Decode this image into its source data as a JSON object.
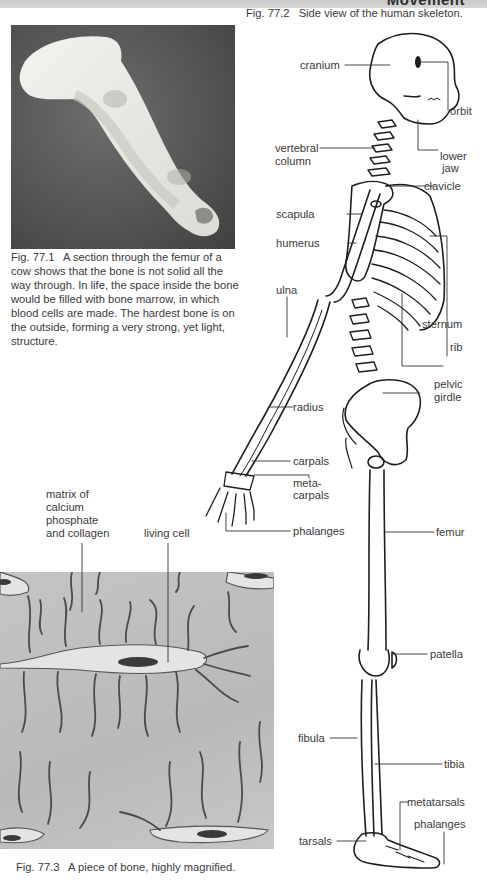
{
  "header": {
    "title": "Movement"
  },
  "figures": {
    "fig1": {
      "number": "Fig. 77.1",
      "caption": "A section through the femur of a cow shows that the bone is not solid all the way through. In life, the space inside the bone would be filled with bone marrow, in which blood cells are made. The hardest bone is on the outside, forming a very strong, yet light, structure.",
      "image_alt": "Photograph of a sectioned cow femur on a dark grey background"
    },
    "fig2": {
      "number": "Fig. 77.2",
      "caption": "Side view of the human skeleton.",
      "labels": {
        "cranium": "cranium",
        "orbit": "orbit",
        "vertebral_column_1": "vertebral",
        "vertebral_column_2": "column",
        "lower_jaw_1": "lower",
        "lower_jaw_2": "jaw",
        "clavicle": "clavicle",
        "scapula": "scapula",
        "humerus": "humerus",
        "ulna": "ulna",
        "sternum": "sternum",
        "rib": "rib",
        "pelvic_girdle_1": "pelvic",
        "pelvic_girdle_2": "girdle",
        "radius": "radius",
        "carpals": "carpals",
        "metacarpals_1": "meta-",
        "metacarpals_2": "carpals",
        "phalanges_hand": "phalanges",
        "femur": "femur",
        "patella": "patella",
        "fibula": "fibula",
        "tibia": "tibia",
        "metatarsals": "metatarsals",
        "phalanges_foot": "phalanges",
        "tarsals": "tarsals"
      }
    },
    "fig3": {
      "number": "Fig. 77.3",
      "caption": "A piece of bone, highly magnified.",
      "labels": {
        "matrix_1": "matrix of",
        "matrix_2": "calcium",
        "matrix_3": "phosphate",
        "matrix_4": "and collagen",
        "living_cell": "living cell"
      }
    }
  },
  "colors": {
    "header_bar": "#cfcfcf",
    "photo_bg": "#5a5a5a",
    "matrix_bg": "#bfbfbf",
    "text": "#3a3a3a"
  }
}
